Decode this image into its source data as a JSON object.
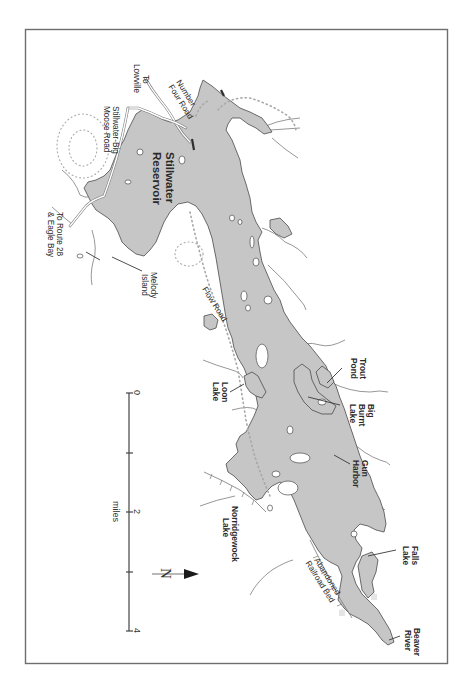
{
  "map": {
    "title": "Stillwater Reservoir",
    "orientation": "rotated 90 degrees clockwise; north arrow points right",
    "colors": {
      "water": "#c6c6c6",
      "shoreline": "#4a4a4a",
      "frame": "#6e6e6e",
      "background": "#ffffff",
      "trail": "#a8a8a8"
    },
    "labels": {
      "reservoir_line1": "Stillwater",
      "reservoir_line2": "Reservoir",
      "number_four_road_line1": "Number",
      "number_four_road_line2": "Four Road",
      "to_lowville_line1": "To",
      "to_lowville_line2": "Lowville",
      "stillwater_big_moose_line1": "Stillwater-Big",
      "stillwater_big_moose_line2": "Moose Road",
      "to_route28_line1": "To Route 28",
      "to_route28_line2": "& Eagle Bay",
      "melody_island_line1": "Melody",
      "melody_island_line2": "Island",
      "flow_road": "Flow Road",
      "loon_lake_line1": "Loon",
      "loon_lake_line2": "Lake",
      "trout_pond_line1": "Trout",
      "trout_pond_line2": "Pond",
      "big_burnt_lake_line1": "Big",
      "big_burnt_lake_line2": "Burnt",
      "big_burnt_lake_line3": "Lake",
      "gun_harbor_line1": "Gun",
      "gun_harbor_line2": "Harbor",
      "norridgewock_lake_line1": "Norridgewock",
      "norridgewock_lake_line2": "Lake",
      "abandoned_railroad_line1": "Abandoned",
      "abandoned_railroad_line2": "Railroad Bed",
      "falls_lake_line1": "Falls",
      "falls_lake_line2": "Lake",
      "beaver_river_line1": "Beaver",
      "beaver_river_line2": "River"
    },
    "scale": {
      "unit": "miles",
      "ticks": [
        "0",
        "",
        "2",
        "",
        "4"
      ]
    },
    "north_arrow": {
      "letter": "N",
      "direction": "right"
    }
  }
}
